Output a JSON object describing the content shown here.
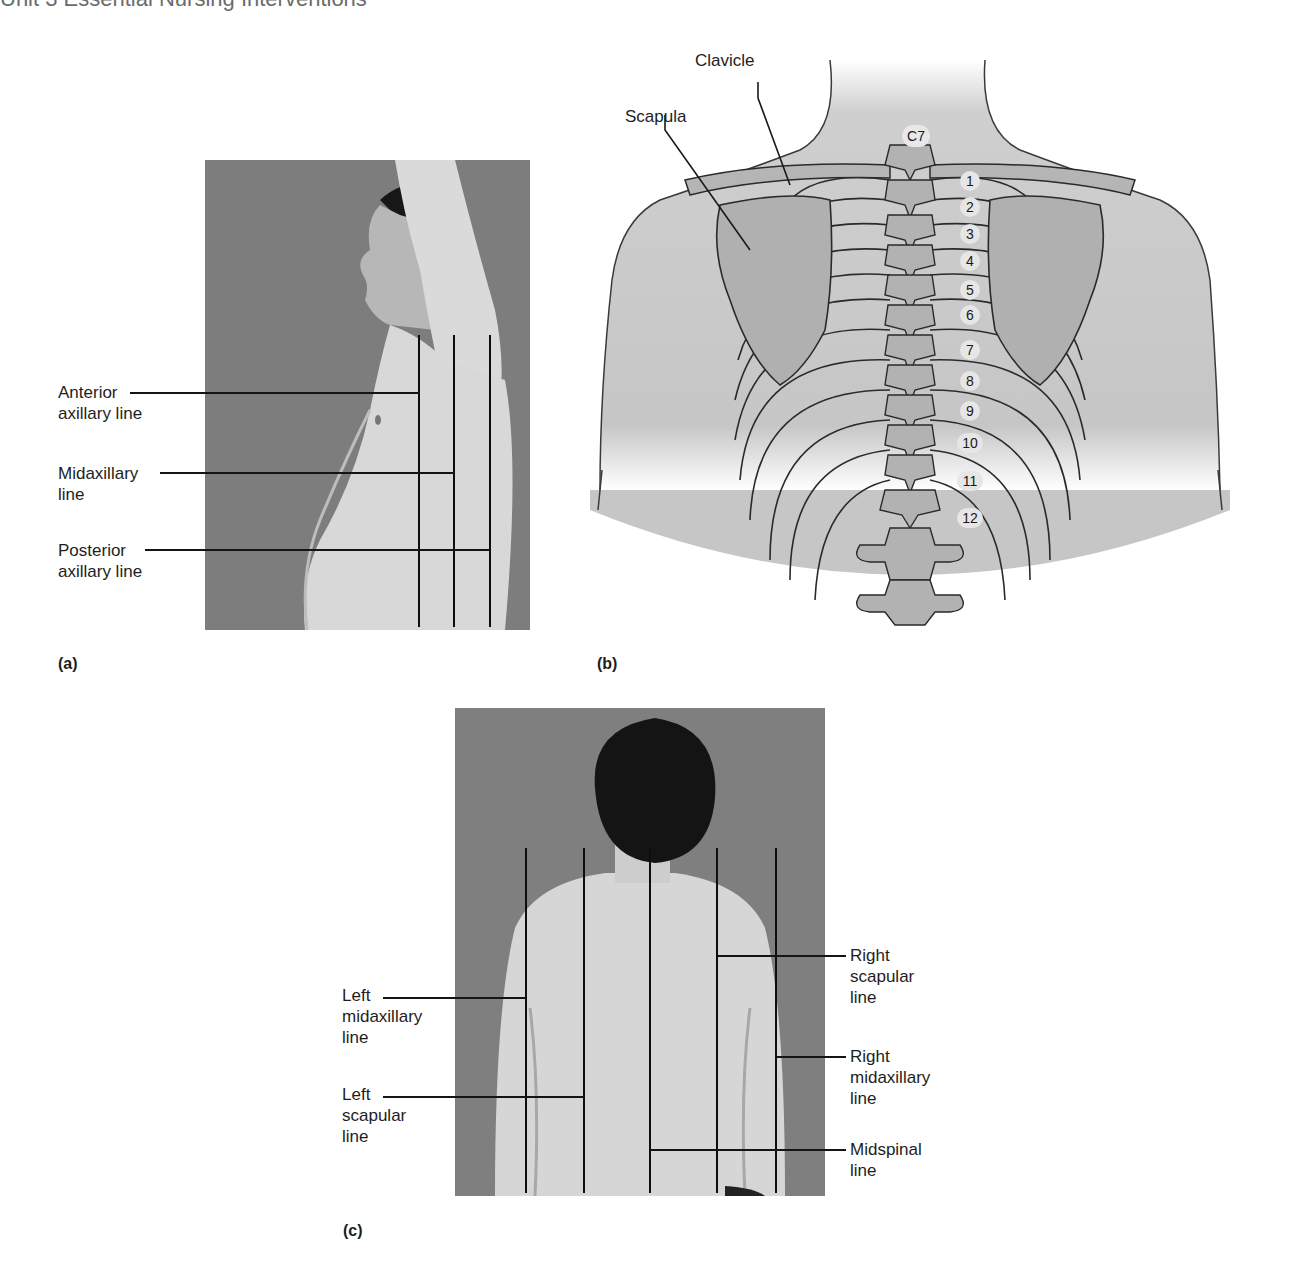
{
  "header": {
    "text": "Unit 3  Essential Nursing Interventions"
  },
  "panels": {
    "a": {
      "tag": "(a)",
      "labels": [
        {
          "line1": "Anterior",
          "line2": "axillary line"
        },
        {
          "line1": "Midaxillary",
          "line2": "line"
        },
        {
          "line1": "Posterior",
          "line2": "axillary line"
        }
      ]
    },
    "b": {
      "tag": "(b)",
      "labels": {
        "clavicle": "Clavicle",
        "scapula": "Scapula"
      },
      "vertebra_top": "C7",
      "ribs": [
        "1",
        "2",
        "3",
        "4",
        "5",
        "6",
        "7",
        "8",
        "9",
        "10",
        "11",
        "12"
      ]
    },
    "c": {
      "tag": "(c)",
      "left_labels": [
        {
          "line1": "Left",
          "line2": "midaxillary",
          "line3": "line"
        },
        {
          "line1": "Left",
          "line2": "scapular",
          "line3": "line"
        }
      ],
      "right_labels": [
        {
          "line1": "Right",
          "line2": "scapular",
          "line3": "line"
        },
        {
          "line1": "Right",
          "line2": "midaxillary",
          "line3": "line"
        },
        {
          "line1": "Midspinal",
          "line2": "line"
        }
      ]
    }
  },
  "colors": {
    "photo_bg": "#7c7c7c",
    "skin": "#d9d9d9",
    "hair": "#151515",
    "diagram_body": "#c8c8c8",
    "diagram_bone": "#a9a9a9",
    "outline": "#2a2a2a"
  }
}
